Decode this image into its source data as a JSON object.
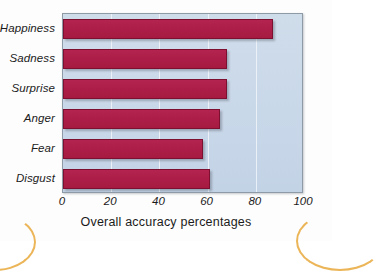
{
  "chart_data": {
    "type": "bar",
    "orientation": "horizontal",
    "title": "",
    "subtitle": "",
    "categories": [
      "Happiness",
      "Sadness",
      "Surprise",
      "Anger",
      "Fear",
      "Disgust"
    ],
    "values": [
      87,
      68,
      68,
      65,
      58,
      61
    ],
    "series": [
      {
        "name": "Overall accuracy percentages",
        "values": [
          87,
          68,
          68,
          65,
          58,
          61
        ]
      }
    ],
    "xlabel": "Overall accuracy percentages",
    "ylabel": "",
    "xlim": [
      0,
      100
    ],
    "xticks": [
      0,
      20,
      40,
      60,
      80,
      100
    ],
    "xtick_labels": [
      "0",
      "20",
      "40",
      "60",
      "80",
      "100"
    ],
    "grid": true,
    "grid_axis": "x",
    "legend": false,
    "legend_position": "none",
    "annotations": []
  },
  "style": {
    "bar_color": "#AD1F48",
    "bar_edge_color": "#7D1030",
    "plot_background": "#C9D8E9",
    "plot_border_color": "#8E9AA6",
    "gridline_color": "#EEF3F8",
    "text_color": "#1B1B1B",
    "page_background": "#FDFDFD",
    "corner_arc_color": "#E8A93C"
  }
}
